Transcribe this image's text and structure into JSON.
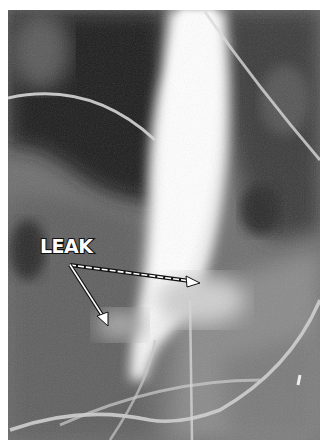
{
  "image": {
    "type": "radiograph",
    "description": "Contrast fluoroscopy showing bright contrast column with leakage",
    "annotation": {
      "label": "LEAK",
      "arrows": [
        {
          "name": "arrow-right",
          "from": [
            68,
            265
          ],
          "to": [
            200,
            282
          ]
        },
        {
          "name": "arrow-down",
          "from": [
            68,
            265
          ],
          "to": [
            108,
            325
          ]
        }
      ]
    },
    "colors": {
      "background": "#ffffff",
      "label_fill": "#ffffff",
      "label_outline": "#111111"
    }
  }
}
